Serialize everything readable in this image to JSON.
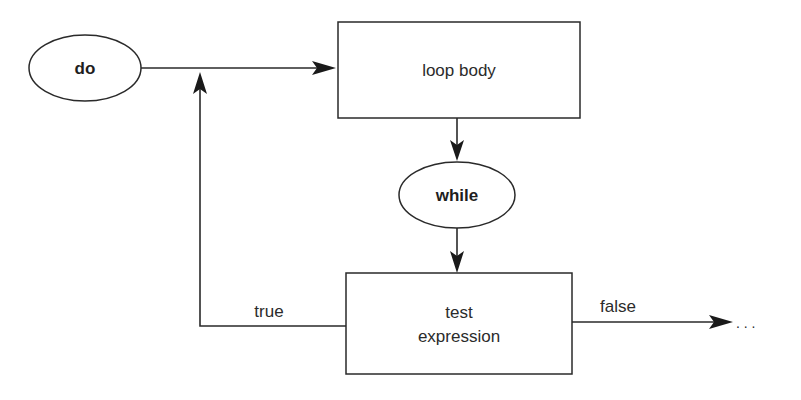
{
  "diagram": {
    "nodes": {
      "start": {
        "label": "do",
        "shape": "ellipse"
      },
      "body": {
        "label": "loop body",
        "shape": "rectangle"
      },
      "while": {
        "label": "while",
        "shape": "ellipse"
      },
      "test": {
        "label_line1": "test",
        "label_line2": "expression",
        "shape": "rectangle"
      }
    },
    "edges": {
      "true_label": "true",
      "false_label": "false",
      "continuation": ". . ."
    },
    "colors": {
      "line": "#2a2a2a",
      "text": "#2b2b2b",
      "background": "#ffffff"
    }
  }
}
